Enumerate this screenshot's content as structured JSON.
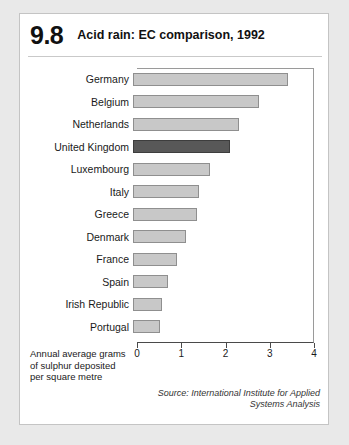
{
  "figure": {
    "number": "9.8",
    "title": "Acid rain: EC comparison, 1992"
  },
  "axis_caption": {
    "line1": "Annual average grams",
    "line2": "of sulphur deposited",
    "line3": "per square metre"
  },
  "source": {
    "line1": "Source: International Institute for Applied",
    "line2": "Systems Analysis"
  },
  "colors": {
    "bar": "#c8c8c8",
    "bar_border": "#8f8f8f",
    "highlight": "#585858",
    "highlight_border": "#3d3d3d",
    "card": "#ffffff",
    "page_background": "#e9e9e9"
  },
  "chart_data": {
    "type": "bar",
    "orientation": "horizontal",
    "title": "Acid rain: EC comparison, 1992",
    "xlabel": "Annual average grams of sulphur deposited per square metre",
    "ylabel": "",
    "xlim": [
      0,
      4
    ],
    "xticks": [
      0,
      1,
      2,
      3,
      4
    ],
    "xtick_labels": [
      "0",
      "1",
      "2",
      "3",
      "4"
    ],
    "grid": false,
    "legend": "none",
    "highlight_category": "United Kingdom",
    "categories": [
      "Germany",
      "Belgium",
      "Netherlands",
      "United Kingdom",
      "Luxembourg",
      "Italy",
      "Greece",
      "Denmark",
      "France",
      "Spain",
      "Irish Republic",
      "Portugal"
    ],
    "values": [
      3.5,
      2.85,
      2.4,
      2.2,
      1.75,
      1.5,
      1.45,
      1.2,
      1.0,
      0.8,
      0.65,
      0.6
    ]
  }
}
